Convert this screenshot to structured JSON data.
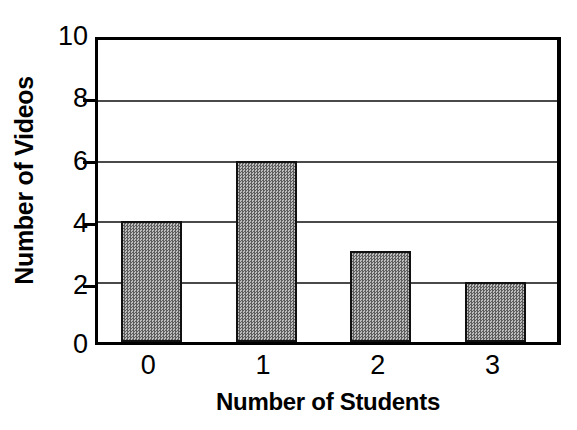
{
  "chart_data": {
    "type": "bar",
    "title": "",
    "xlabel": "Number of Students",
    "ylabel": "Number of Videos",
    "categories": [
      "0",
      "1",
      "2",
      "3"
    ],
    "values": [
      4,
      6,
      3,
      2
    ],
    "ylim": [
      0,
      10
    ],
    "y_ticks": [
      0,
      2,
      4,
      6,
      8,
      10
    ],
    "y_tick_labels": [
      "0",
      "2",
      "4",
      "6",
      "8",
      "10"
    ],
    "x_tick_labels": [
      "0",
      "1",
      "2",
      "3"
    ],
    "grid": true,
    "gridlines_at": [
      2,
      4,
      6,
      8
    ],
    "legend": null,
    "legend_position": "none",
    "bar_fill_color": "#8d8d8d",
    "bar_border_color": "#111111",
    "axis_color": "#000000",
    "gridline_color": "#4a4a4a",
    "background_color": "#ffffff"
  },
  "axes": {
    "y_title": "Number of Videos",
    "x_title": "Number of Students"
  },
  "y_tick_labels": [
    {
      "label": "10"
    },
    {
      "label": "8"
    },
    {
      "label": "6"
    },
    {
      "label": "4"
    },
    {
      "label": "2"
    },
    {
      "label": "0"
    }
  ],
  "x_tick_labels": [
    {
      "label": "0"
    },
    {
      "label": "1"
    },
    {
      "label": "2"
    },
    {
      "label": "3"
    }
  ]
}
